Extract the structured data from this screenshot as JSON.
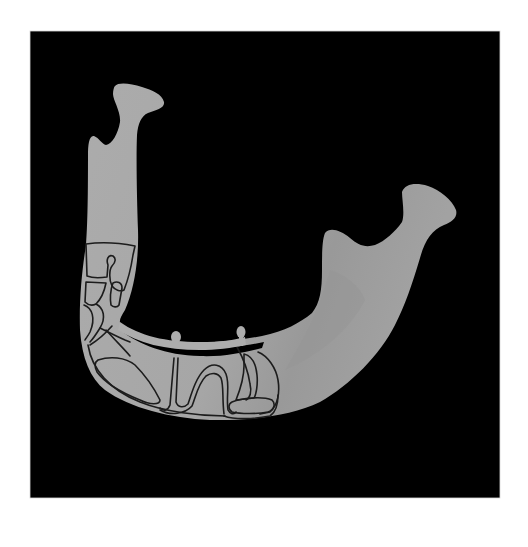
{
  "figure": {
    "colors": {
      "page_background": "#ffffff",
      "frame_background": "#000000",
      "bone": "#a9a9a9",
      "bone_shadow": "#9a9a9a",
      "framework_outline": "#1e1e1e",
      "framework_bar": "#b0b0b0"
    },
    "frame": {
      "x": 30,
      "y": 31,
      "width": 470,
      "height": 467
    },
    "labels": []
  }
}
